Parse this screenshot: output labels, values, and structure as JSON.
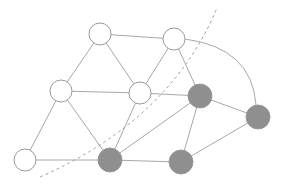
{
  "diagram": {
    "type": "graph-partition",
    "colors": {
      "edge": "#a8a8a8",
      "node_stroke": "#9a9a9a",
      "node_fill_white": "#ffffff",
      "node_fill_gray": "#8f8f8f",
      "cut_line": "#a0a0a0"
    },
    "nodes": [
      {
        "id": "A",
        "x": 100,
        "y": 34,
        "r": 11,
        "group": "white"
      },
      {
        "id": "B",
        "x": 174,
        "y": 39,
        "r": 11,
        "group": "white"
      },
      {
        "id": "C",
        "x": 61,
        "y": 91,
        "r": 11,
        "group": "white"
      },
      {
        "id": "D",
        "x": 140,
        "y": 93,
        "r": 11,
        "group": "white"
      },
      {
        "id": "E",
        "x": 200,
        "y": 96,
        "r": 12,
        "group": "gray"
      },
      {
        "id": "F",
        "x": 258,
        "y": 117,
        "r": 12,
        "group": "gray"
      },
      {
        "id": "G",
        "x": 25,
        "y": 160,
        "r": 11,
        "group": "white"
      },
      {
        "id": "H",
        "x": 110,
        "y": 160,
        "r": 12,
        "group": "gray"
      },
      {
        "id": "I",
        "x": 181,
        "y": 162,
        "r": 12,
        "group": "gray"
      }
    ],
    "edges": [
      [
        "A",
        "B"
      ],
      [
        "A",
        "C"
      ],
      [
        "A",
        "D"
      ],
      [
        "B",
        "D"
      ],
      [
        "B",
        "E"
      ],
      [
        "C",
        "D"
      ],
      [
        "C",
        "G"
      ],
      [
        "C",
        "H"
      ],
      [
        "D",
        "E"
      ],
      [
        "D",
        "H"
      ],
      [
        "E",
        "F"
      ],
      [
        "E",
        "H"
      ],
      [
        "E",
        "I"
      ],
      [
        "F",
        "I"
      ],
      [
        "G",
        "H"
      ],
      [
        "H",
        "I"
      ]
    ],
    "arcs": [
      {
        "from": "B",
        "to": "F",
        "path": "M 185 39 Q 252 48 256 105"
      }
    ],
    "cut_line": {
      "style": "dashed",
      "path": "M 40 177 Q 170 120 217 8"
    }
  }
}
